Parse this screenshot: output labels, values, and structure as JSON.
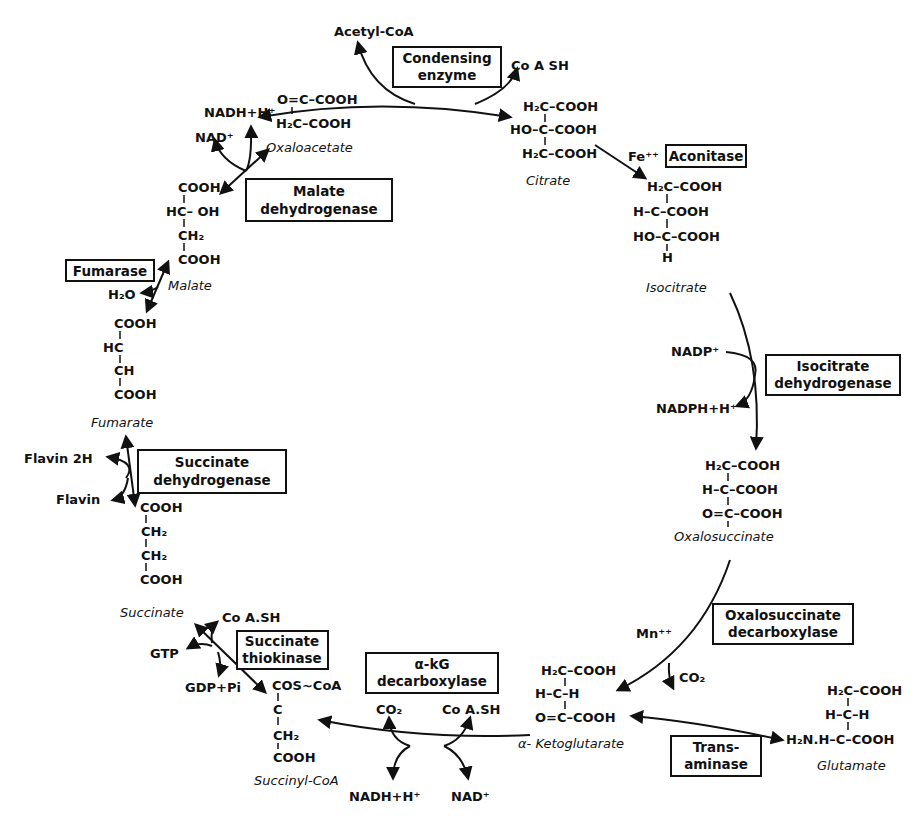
{
  "colors": {
    "ink": "#111111",
    "background": "#ffffff"
  },
  "cofactors": {
    "acetyl_coa": "Acetyl-CoA",
    "coash_top": "Co A SH",
    "nadh_malate": "NADH+H⁺",
    "nad_malate": "NAD⁺",
    "fe": "Fe⁺⁺",
    "nadp": "NADP⁺",
    "nadph": "NADPH+H⁺",
    "mn": "Mn⁺⁺",
    "co2_oxalo": "CO₂",
    "co2_akg": "CO₂",
    "coash_akg": "Co A.SH",
    "nadh_akg": "NADH+H⁺",
    "nad_akg": "NAD⁺",
    "coash_succ": "Co A.SH",
    "gtp": "GTP",
    "gdp": "GDP+Pi",
    "flavin2h": "Flavin 2H",
    "flavin": "Flavin",
    "h2o": "H₂O"
  },
  "enzymes": {
    "condensing": [
      "Condensing",
      "enzyme"
    ],
    "aconitase": [
      "Aconitase"
    ],
    "isocitrate_dh": [
      "Isocitrate",
      "dehydrogenase"
    ],
    "oxalosuccinate_dc": [
      "Oxalosuccinate",
      "decarboxylase"
    ],
    "transaminase": [
      "Trans-",
      "aminase"
    ],
    "akg_dc": [
      "α-kG",
      "decarboxylase"
    ],
    "succinate_thiokinase": [
      "Succinate",
      "thiokinase"
    ],
    "succinate_dh": [
      "Succinate",
      "dehydrogenase"
    ],
    "fumarase": [
      "Fumarase"
    ],
    "malate_dh": [
      "Malate",
      "dehydrogenase"
    ]
  },
  "metabolites": {
    "oxaloacetate": {
      "name": "Oxaloacetate",
      "lines": [
        "O=C–COOH",
        "H₂C–COOH"
      ]
    },
    "citrate": {
      "name": "Citrate",
      "lines": [
        "H₂C–COOH",
        "HO–C–COOH",
        "H₂C–COOH"
      ]
    },
    "isocitrate": {
      "name": "Isocitrate",
      "lines": [
        "H₂C–COOH",
        "H–C–COOH",
        "HO–C–COOH",
        "H"
      ]
    },
    "oxalosuccinate": {
      "name": "Oxalosuccinate",
      "lines": [
        "H₂C–COOH",
        "H–C–COOH",
        "O=C–COOH"
      ]
    },
    "ketoglutarate": {
      "name": "α- Ketoglutarate",
      "lines": [
        "H₂C–COOH",
        "H–C–H",
        "O=C–COOH"
      ]
    },
    "glutamate": {
      "name": "Glutamate",
      "lines": [
        "H₂C–COOH",
        "H–C–H",
        "H₂N.H–C–COOH"
      ]
    },
    "succinyl_coa": {
      "name": "Succinyl-CoA",
      "lines": [
        "COS~CoA",
        "C",
        "CH₂",
        "COOH"
      ]
    },
    "succinate": {
      "name": "Succinate",
      "lines": [
        "COOH",
        "CH₂",
        "CH₂",
        "COOH"
      ]
    },
    "fumarate": {
      "name": "Fumarate",
      "lines": [
        "COOH",
        "HC",
        "CH",
        "COOH"
      ]
    },
    "malate": {
      "name": "Malate",
      "lines": [
        "COOH",
        "HC– OH",
        "CH₂",
        "COOH"
      ]
    }
  }
}
